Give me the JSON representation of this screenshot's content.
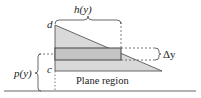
{
  "diagram": {
    "labels": {
      "h": "h(y)",
      "d": "d",
      "c": "c",
      "delta_y": "Δy",
      "p": "p(y)",
      "region": "Plane region"
    },
    "colors": {
      "region_fill": "#d9d9d9",
      "strip_fill": "#bdbdbd",
      "line": "#444444",
      "dash": "#555555"
    }
  }
}
